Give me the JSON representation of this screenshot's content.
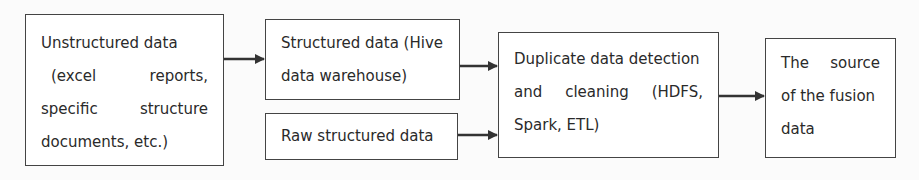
{
  "diagram": {
    "nodes": [
      {
        "id": "unstructured",
        "lines": [
          [
            "Unstructured data"
          ],
          [
            "(excel",
            "reports,"
          ],
          [
            "specific",
            "structure"
          ],
          [
            "documents, etc.)"
          ]
        ]
      },
      {
        "id": "structured",
        "lines": [
          [
            "Structured data (Hive"
          ],
          [
            "data warehouse)"
          ]
        ]
      },
      {
        "id": "raw",
        "lines": [
          [
            "Raw structured data"
          ]
        ]
      },
      {
        "id": "dedup",
        "lines": [
          [
            "Duplicate data detection"
          ],
          [
            "and",
            "cleaning",
            "(HDFS,"
          ],
          [
            "Spark, ETL)"
          ]
        ]
      },
      {
        "id": "fusion",
        "lines": [
          [
            "The",
            "source"
          ],
          [
            "of the fusion"
          ],
          [
            "data"
          ]
        ]
      }
    ],
    "edges": [
      {
        "from": "unstructured",
        "to": "structured"
      },
      {
        "from": "structured",
        "to": "dedup"
      },
      {
        "from": "raw",
        "to": "dedup"
      },
      {
        "from": "dedup",
        "to": "fusion"
      }
    ],
    "colors": {
      "stroke": "#444444",
      "text": "#2a2a2a",
      "background": "#fbfbfb"
    }
  }
}
